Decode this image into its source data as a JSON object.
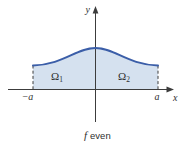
{
  "figure": {
    "axes": {
      "x_label": "x",
      "y_label": "y"
    },
    "bounds": {
      "left_label": "−a",
      "right_label": "a"
    },
    "regions": {
      "left": {
        "symbol": "Ω",
        "subscript": "1"
      },
      "right": {
        "symbol": "Ω",
        "subscript": "2"
      }
    },
    "caption": {
      "function_symbol": "f",
      "property": "even"
    },
    "colors": {
      "curve": "#3b5ea8",
      "fill": "#d5e1ef",
      "axis": "#3c3c3c"
    }
  }
}
